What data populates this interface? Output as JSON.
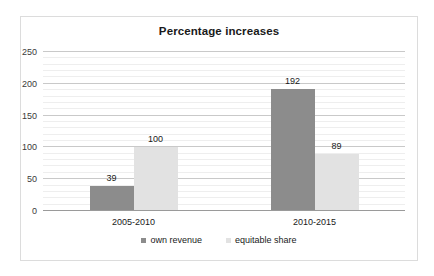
{
  "chart_data": {
    "type": "bar",
    "title": "Percentage increases",
    "xlabel": "",
    "ylabel": "",
    "ylim": [
      0,
      250
    ],
    "yticks": [
      0,
      50,
      100,
      150,
      200,
      250
    ],
    "ytick_labels": [
      "0",
      "50",
      "100",
      "150",
      "200",
      "250"
    ],
    "minor_tick_step": 10,
    "grid": true,
    "legend_position": "bottom",
    "categories": [
      "2005-2010",
      "2010-2015"
    ],
    "series": [
      {
        "name": "own revenue",
        "color": "#8c8c8c",
        "values": [
          39,
          192
        ],
        "labels": [
          "39",
          "192"
        ]
      },
      {
        "name": "equitable share",
        "color": "#e2e2e2",
        "values": [
          100,
          89
        ],
        "labels": [
          "100",
          "89"
        ]
      }
    ]
  },
  "frame": {
    "border_color": "#dcdcdc",
    "background": "#ffffff"
  }
}
